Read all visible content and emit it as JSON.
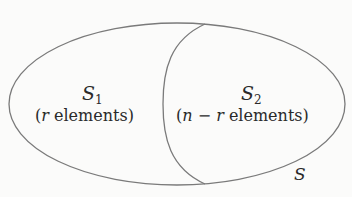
{
  "diagram": {
    "type": "venn-partition",
    "outer_set": {
      "label": "S"
    },
    "regions": [
      {
        "name": "S",
        "sub": "1",
        "description_prefix": "(",
        "var": "r",
        "description_suffix": " elements)"
      },
      {
        "name": "S",
        "sub": "2",
        "description_prefix": "(",
        "var": "n",
        "minus": " − ",
        "var2": "r",
        "description_suffix": " elements)"
      }
    ],
    "colors": {
      "stroke": "#7a7a7a",
      "text": "#2a2a2a",
      "background": "#fbfbfa"
    }
  }
}
